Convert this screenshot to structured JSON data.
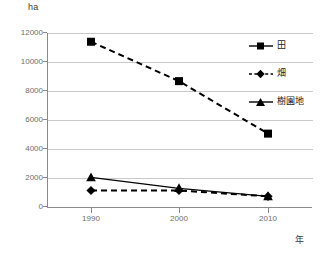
{
  "chart_data": {
    "type": "line",
    "title": "",
    "subtitle": "",
    "xlabel": "年",
    "ylabel": "ha",
    "categories": [
      "1990",
      "2000",
      "2010"
    ],
    "x": [
      1990,
      2000,
      2010
    ],
    "xlim": [
      1985,
      2015
    ],
    "ylim": [
      0,
      12000
    ],
    "ytick_labels": [
      "0",
      "2000",
      "4000",
      "6000",
      "8000",
      "10000",
      "12000"
    ],
    "ytick_values": [
      0,
      2000,
      4000,
      6000,
      8000,
      10000,
      12000
    ],
    "grid": "horizontal",
    "legend_position": "right",
    "series": [
      {
        "name": "田",
        "marker": "square",
        "linestyle": "dashed",
        "color": "#000000",
        "values": [
          11400,
          8700,
          5100
        ]
      },
      {
        "name": "畑",
        "marker": "diamond",
        "linestyle": "dashed",
        "color": "#000000",
        "values": [
          1200,
          1200,
          800
        ]
      },
      {
        "name": "樹園地",
        "marker": "triangle",
        "linestyle": "solid",
        "color": "#000000",
        "values": [
          2100,
          1350,
          800
        ]
      }
    ]
  },
  "axes": {
    "y_unit": "ha",
    "x_unit": "年"
  },
  "legend": {
    "items": [
      {
        "label": "田",
        "marker": "square-marker",
        "style": "solid"
      },
      {
        "label": "畑",
        "marker": "diamond-marker",
        "style": "dashed"
      },
      {
        "label": "樹園地",
        "marker": "triangle-marker",
        "style": "solid"
      }
    ]
  },
  "ticks": {
    "y": [
      {
        "label": "12000",
        "value": 12000
      },
      {
        "label": "10000",
        "value": 10000
      },
      {
        "label": "8000",
        "value": 8000
      },
      {
        "label": "6000",
        "value": 6000
      },
      {
        "label": "4000",
        "value": 4000
      },
      {
        "label": "2000",
        "value": 2000
      },
      {
        "label": "0",
        "value": 0
      }
    ],
    "x": [
      {
        "label": "1990",
        "value": 1990
      },
      {
        "label": "2000",
        "value": 2000
      },
      {
        "label": "2010",
        "value": 2010
      }
    ]
  },
  "colors": {
    "series": "#000000",
    "grid": "#c9c9c9",
    "axis": "#8a8a8a",
    "tick_text": "#6d6d6d",
    "background": "#ffffff"
  }
}
